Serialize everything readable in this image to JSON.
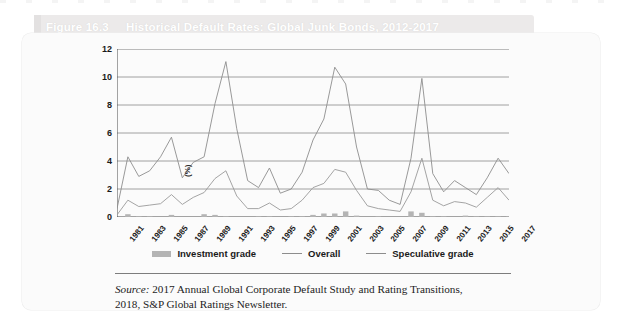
{
  "figure": {
    "number_label": "Figure 16.3",
    "title": "Historical Default Rates: Global Junk Bonds, 2012-2017"
  },
  "source": {
    "prefix": "Source:",
    "line1": " 2017 Annual Global Corporate Default Study and Rating Transitions,",
    "line2": "2018, S&P Global Ratings Newsletter."
  },
  "legend": {
    "items": [
      {
        "label": "Investment grade",
        "marker": "bar",
        "color": "#b4b4b4"
      },
      {
        "label": "Overall",
        "marker": "line",
        "color": "#8d8d8d"
      },
      {
        "label": "Speculative grade",
        "marker": "line",
        "color": "#8d8d8d"
      }
    ]
  },
  "chart_data": {
    "type": "line",
    "title": "Historical Default Rates: Global Junk Bonds, 2012-2017",
    "xlabel": "",
    "ylabel": "(%)",
    "ylim": [
      0,
      12
    ],
    "yticks": [
      0,
      2,
      4,
      6,
      8,
      10,
      12
    ],
    "grid": true,
    "legend_position": "bottom",
    "x": [
      1981,
      1982,
      1983,
      1984,
      1985,
      1986,
      1987,
      1988,
      1989,
      1990,
      1991,
      1992,
      1993,
      1994,
      1995,
      1996,
      1997,
      1998,
      1999,
      2000,
      2001,
      2002,
      2003,
      2004,
      2005,
      2006,
      2007,
      2008,
      2009,
      2010,
      2011,
      2012,
      2013,
      2014,
      2015,
      2016,
      2017
    ],
    "xticks": [
      1981,
      1983,
      1985,
      1987,
      1989,
      1991,
      1993,
      1995,
      1997,
      1999,
      2001,
      2003,
      2005,
      2007,
      2009,
      2011,
      2013,
      2015,
      2017
    ],
    "xtick_labels": [
      "1981",
      "1983",
      "1985",
      "1987",
      "1989",
      "1991",
      "1993",
      "1995",
      "1997",
      "1999",
      "2001",
      "2003",
      "2005",
      "2007",
      "2009",
      "2011",
      "2013",
      "2015",
      "2017"
    ],
    "series": [
      {
        "name": "Speculative grade",
        "type": "line",
        "color": "#8d8d8d",
        "values": [
          0.6,
          4.3,
          2.9,
          3.3,
          4.3,
          5.7,
          2.8,
          3.9,
          4.3,
          8.1,
          11.1,
          6.3,
          2.6,
          2.1,
          3.5,
          1.7,
          2.0,
          3.2,
          5.5,
          7.0,
          10.7,
          9.5,
          5.0,
          2.0,
          1.9,
          1.2,
          0.9,
          4.2,
          9.9,
          3.1,
          1.8,
          2.6,
          2.1,
          1.6,
          2.8,
          4.2,
          3.1
        ]
      },
      {
        "name": "Overall",
        "type": "line",
        "color": "#9a9a9a",
        "values": [
          0.15,
          1.2,
          0.75,
          0.85,
          0.95,
          1.6,
          0.9,
          1.4,
          1.75,
          2.75,
          3.3,
          1.5,
          0.6,
          0.6,
          1.0,
          0.5,
          0.6,
          1.2,
          2.1,
          2.4,
          3.4,
          3.2,
          1.9,
          0.8,
          0.6,
          0.5,
          0.4,
          1.8,
          4.2,
          1.2,
          0.8,
          1.1,
          1.0,
          0.7,
          1.4,
          2.1,
          1.2
        ]
      },
      {
        "name": "Investment grade",
        "type": "bar",
        "color": "#b4b4b4",
        "values": [
          0.0,
          0.2,
          0.05,
          0.05,
          0.0,
          0.15,
          0.0,
          0.0,
          0.2,
          0.15,
          0.05,
          0.0,
          0.0,
          0.05,
          0.05,
          0.0,
          0.05,
          0.05,
          0.15,
          0.25,
          0.25,
          0.4,
          0.1,
          0.0,
          0.05,
          0.0,
          0.0,
          0.4,
          0.3,
          0.05,
          0.05,
          0.0,
          0.1,
          0.05,
          0.05,
          0.05,
          0.05
        ]
      }
    ]
  }
}
